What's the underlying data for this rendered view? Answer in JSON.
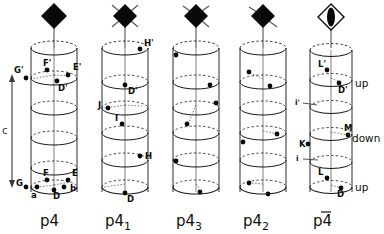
{
  "figure": {
    "title": "",
    "background_color": "#ffffff",
    "ink_color": "#111111",
    "axis": {
      "label": "c",
      "name": "c-axis-double-arrow"
    }
  },
  "columns": [
    {
      "id": "p4",
      "caption": "p4",
      "caption_overbar": false,
      "caption_subscript": "",
      "symbol": {
        "name": "tetrad-axis-symbol",
        "kind": "filled-diamond",
        "tails": 0,
        "inverted": false
      },
      "point_labels": [
        {
          "text": "F'",
          "x": 43,
          "y": 66
        },
        {
          "text": "E'",
          "x": 73,
          "y": 70
        },
        {
          "text": "G'",
          "x": 18,
          "y": 73
        },
        {
          "text": "D'",
          "x": 60,
          "y": 87
        },
        {
          "text": "F",
          "x": 43,
          "y": 176
        },
        {
          "text": "E",
          "x": 72,
          "y": 175
        },
        {
          "text": "G",
          "x": 19,
          "y": 183
        },
        {
          "text": "a",
          "x": 33,
          "y": 193
        },
        {
          "text": "b",
          "x": 71,
          "y": 189
        },
        {
          "text": "D",
          "x": 56,
          "y": 194
        }
      ],
      "dots": [
        {
          "x": 47,
          "y": 70
        },
        {
          "x": 68,
          "y": 75
        },
        {
          "x": 26,
          "y": 78
        },
        {
          "x": 57,
          "y": 81
        },
        {
          "x": 47,
          "y": 180
        },
        {
          "x": 68,
          "y": 180
        },
        {
          "x": 26,
          "y": 187
        },
        {
          "x": 37,
          "y": 187
        },
        {
          "x": 64,
          "y": 187
        },
        {
          "x": 54,
          "y": 190
        }
      ]
    },
    {
      "id": "p4-1",
      "caption": "p4",
      "caption_overbar": false,
      "caption_subscript": "1",
      "symbol": {
        "name": "tetrad-screw-axis-symbol",
        "kind": "filled-diamond",
        "tails": 4,
        "inverted": false
      },
      "point_labels": [
        {
          "text": "H'",
          "x": 146,
          "y": 44
        },
        {
          "text": "D'",
          "x": 130,
          "y": 90
        },
        {
          "text": "J",
          "x": 101,
          "y": 105
        },
        {
          "text": "I",
          "x": 118,
          "y": 119
        },
        {
          "text": "H",
          "x": 146,
          "y": 153
        },
        {
          "text": "D",
          "x": 129,
          "y": 199
        }
      ],
      "dots": [
        {
          "x": 140,
          "y": 49
        },
        {
          "x": 125,
          "y": 85
        },
        {
          "x": 108,
          "y": 108
        },
        {
          "x": 122,
          "y": 124
        },
        {
          "x": 140,
          "y": 156
        },
        {
          "x": 125,
          "y": 193
        }
      ]
    },
    {
      "id": "p4-3",
      "caption": "p4",
      "caption_overbar": false,
      "caption_subscript": "3",
      "symbol": {
        "name": "tetrad-screw-axis-symbol",
        "kind": "filled-diamond",
        "tails": 3,
        "inverted": false
      },
      "point_labels": [],
      "dots": [
        {
          "x": 176,
          "y": 55
        },
        {
          "x": 210,
          "y": 85
        },
        {
          "x": 216,
          "y": 103
        },
        {
          "x": 187,
          "y": 124
        },
        {
          "x": 176,
          "y": 161
        },
        {
          "x": 200,
          "y": 192
        }
      ]
    },
    {
      "id": "p4-2",
      "caption": "p4",
      "caption_overbar": false,
      "caption_subscript": "2",
      "symbol": {
        "name": "tetrad-screw-axis-symbol",
        "kind": "filled-diamond",
        "tails": 2,
        "inverted": false
      },
      "point_labels": [],
      "dots": [
        {
          "x": 249,
          "y": 72
        },
        {
          "x": 270,
          "y": 86
        },
        {
          "x": 277,
          "y": 134
        },
        {
          "x": 243,
          "y": 142
        },
        {
          "x": 249,
          "y": 183
        },
        {
          "x": 268,
          "y": 194
        }
      ]
    },
    {
      "id": "p4-bar",
      "caption": "p4",
      "caption_overbar": true,
      "caption_subscript": "",
      "symbol": {
        "name": "inverse-tetrad-axis-symbol",
        "kind": "open-diamond-with-lens",
        "tails": 0,
        "inverted": true
      },
      "point_labels": [
        {
          "text": "L'",
          "x": 320,
          "y": 66
        },
        {
          "text": "D'",
          "x": 343,
          "y": 88
        },
        {
          "text": "i'",
          "x": 296,
          "y": 103
        },
        {
          "text": "M",
          "x": 345,
          "y": 128
        },
        {
          "text": "K",
          "x": 300,
          "y": 146
        },
        {
          "text": "i",
          "x": 296,
          "y": 158
        },
        {
          "text": "L",
          "x": 320,
          "y": 174
        },
        {
          "text": "D",
          "x": 340,
          "y": 194
        }
      ],
      "word_labels": [
        {
          "text": "up",
          "x": 359,
          "y": 83
        },
        {
          "text": "down",
          "x": 352,
          "y": 141
        },
        {
          "text": "up",
          "x": 359,
          "y": 188
        }
      ],
      "dots": [
        {
          "x": 327,
          "y": 70
        },
        {
          "x": 339,
          "y": 83
        },
        {
          "x": 348,
          "y": 135
        },
        {
          "x": 308,
          "y": 144
        },
        {
          "x": 327,
          "y": 178
        },
        {
          "x": 341,
          "y": 188
        }
      ]
    }
  ]
}
